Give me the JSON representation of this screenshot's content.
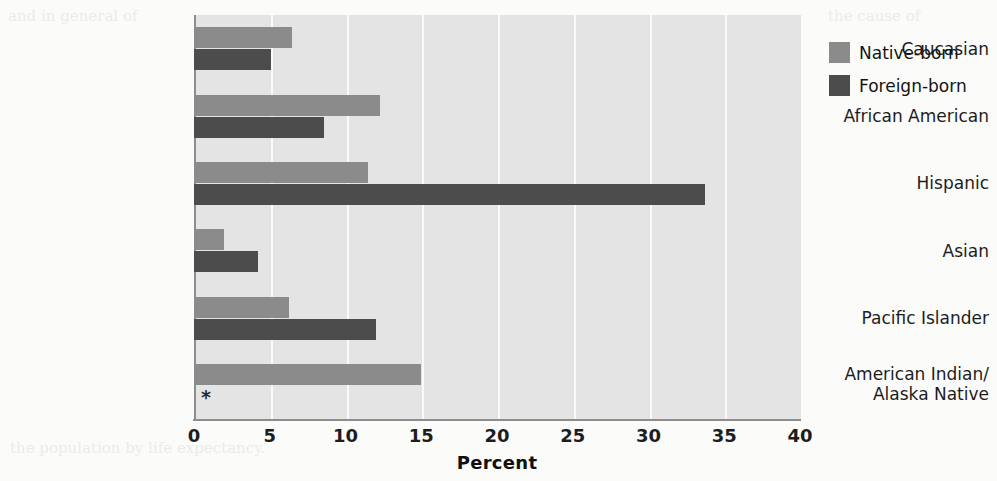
{
  "chart_data": {
    "type": "bar",
    "orientation": "horizontal",
    "title": "",
    "xlabel": "Percent",
    "ylabel": "",
    "xlim": [
      0,
      40
    ],
    "xticks": [
      0,
      5,
      10,
      15,
      20,
      25,
      30,
      35,
      40
    ],
    "grid": "vertical",
    "legend_position": "right",
    "categories": [
      "Caucasian",
      "African American",
      "Hispanic",
      "Asian",
      "Pacific Islander",
      "American Indian/\nAlaska Native"
    ],
    "series": [
      {
        "name": "Native-born",
        "color": "#8b8b8b",
        "values": [
          6.5,
          12.3,
          11.5,
          2.0,
          6.3,
          15.0
        ]
      },
      {
        "name": "Foreign-born",
        "color": "#4c4c4c",
        "values": [
          5.1,
          8.6,
          33.7,
          4.2,
          12.0,
          null
        ]
      }
    ],
    "annotations": [
      {
        "text": "*",
        "category": "American Indian/Alaska Native",
        "series": "Foreign-born",
        "meaning": "no-data"
      }
    ]
  },
  "axis": {
    "x_title": "Percent",
    "tick_labels": [
      "0",
      "5",
      "10",
      "15",
      "20",
      "25",
      "30",
      "35",
      "40"
    ]
  },
  "categories": [
    {
      "line1": "Caucasian",
      "line2": ""
    },
    {
      "line1": "African American",
      "line2": ""
    },
    {
      "line1": "Hispanic",
      "line2": ""
    },
    {
      "line1": "Asian",
      "line2": ""
    },
    {
      "line1": "Pacific Islander",
      "line2": ""
    },
    {
      "line1": "American Indian/",
      "line2": "Alaska Native"
    }
  ],
  "legend": {
    "items": [
      {
        "label": "Native-born",
        "color": "#8b8b8b"
      },
      {
        "label": "Foreign-born",
        "color": "#4c4c4c"
      }
    ]
  },
  "marks": {
    "no_data": "*"
  },
  "ghost_text": {
    "left": "and in general of",
    "right": "the cause of",
    "bottom": "the population by life expectancy."
  }
}
